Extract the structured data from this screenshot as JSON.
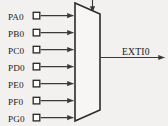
{
  "diagram": {
    "background_color": "#f2f1ef",
    "line_color": "#3a3a3a",
    "block": {
      "name": "multiplexer",
      "shape": "trapezoid",
      "label": ""
    },
    "inputs": [
      {
        "label": "PA0",
        "terminal": "square-port-terminal"
      },
      {
        "label": "PB0",
        "terminal": "square-port-terminal"
      },
      {
        "label": "PC0",
        "terminal": "square-port-terminal"
      },
      {
        "label": "PD0",
        "terminal": "square-port-terminal"
      },
      {
        "label": "PE0",
        "terminal": "square-port-terminal"
      },
      {
        "label": "PF0",
        "terminal": "square-port-terminal"
      },
      {
        "label": "PG0",
        "terminal": "square-port-terminal"
      }
    ],
    "output": {
      "label": "EXTI0"
    },
    "select": {
      "label": ""
    }
  }
}
